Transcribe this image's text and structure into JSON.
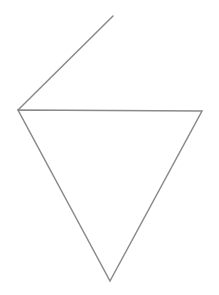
{
  "canvas": {
    "width": 219,
    "height": 295,
    "background_color": "#ffffff"
  },
  "figure": {
    "stroke_color": "#8a8a8a",
    "stroke_width": 1.5,
    "shapes": [
      {
        "name": "inverted-triangle",
        "type": "polygon",
        "closed": true,
        "points": "18,110 202,111 110,281",
        "vertices": [
          {
            "label": "left-vertex",
            "x": 18,
            "y": 110
          },
          {
            "label": "right-vertex",
            "x": 202,
            "y": 111
          },
          {
            "label": "bottom-apex",
            "x": 110,
            "y": 281
          }
        ],
        "fill": "none"
      },
      {
        "name": "upper-ray",
        "type": "polyline",
        "closed": false,
        "points": "18,110 113,16",
        "vertices": [
          {
            "label": "ray-start-at-left-vertex",
            "x": 18,
            "y": 110
          },
          {
            "label": "ray-end-top",
            "x": 113,
            "y": 16
          }
        ],
        "fill": "none"
      }
    ]
  }
}
